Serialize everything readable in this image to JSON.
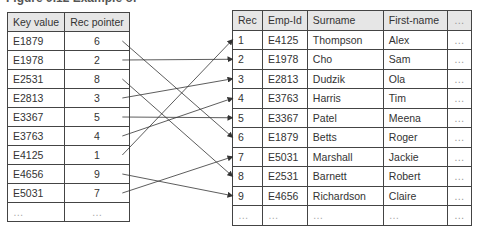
{
  "title": "Figure 9.12 Example of",
  "index_table": {
    "headers": [
      "Key value",
      "Rec pointer"
    ],
    "rows": [
      {
        "key": "E1879",
        "ptr": "6"
      },
      {
        "key": "E1978",
        "ptr": "2"
      },
      {
        "key": "E2531",
        "ptr": "8"
      },
      {
        "key": "E2813",
        "ptr": "3"
      },
      {
        "key": "E3367",
        "ptr": "5"
      },
      {
        "key": "E3763",
        "ptr": "4"
      },
      {
        "key": "E4125",
        "ptr": "1"
      },
      {
        "key": "E4656",
        "ptr": "9"
      },
      {
        "key": "E5031",
        "ptr": "7"
      },
      {
        "key": "…",
        "ptr": "…"
      }
    ]
  },
  "data_table": {
    "headers": [
      "Rec",
      "Emp-Id",
      "Surname",
      "First-name",
      "…"
    ],
    "rows": [
      {
        "rec": "1",
        "emp": "E4125",
        "surname": "Thompson",
        "first": "Alex",
        "more": "…"
      },
      {
        "rec": "2",
        "emp": "E1978",
        "surname": "Cho",
        "first": "Sam",
        "more": "…"
      },
      {
        "rec": "3",
        "emp": "E2813",
        "surname": "Dudzik",
        "first": "Ola",
        "more": "…"
      },
      {
        "rec": "4",
        "emp": "E3763",
        "surname": "Harris",
        "first": "Tim",
        "more": "…"
      },
      {
        "rec": "5",
        "emp": "E3367",
        "surname": "Patel",
        "first": "Meena",
        "more": "…"
      },
      {
        "rec": "6",
        "emp": "E1879",
        "surname": "Betts",
        "first": "Roger",
        "more": "…"
      },
      {
        "rec": "7",
        "emp": "E5031",
        "surname": "Marshall",
        "first": "Jackie",
        "more": "…"
      },
      {
        "rec": "8",
        "emp": "E2531",
        "surname": "Barnett",
        "first": "Robert",
        "more": "…"
      },
      {
        "rec": "9",
        "emp": "E4656",
        "surname": "Richardson",
        "first": "Claire",
        "more": "…"
      },
      {
        "rec": "…",
        "emp": "…",
        "surname": "…",
        "first": "…",
        "more": "…"
      }
    ]
  },
  "arrows": [
    {
      "from_key": "E1879",
      "to_rec": "6"
    },
    {
      "from_key": "E1978",
      "to_rec": "2"
    },
    {
      "from_key": "E2531",
      "to_rec": "8"
    },
    {
      "from_key": "E2813",
      "to_rec": "3"
    },
    {
      "from_key": "E3367",
      "to_rec": "5"
    },
    {
      "from_key": "E3763",
      "to_rec": "4"
    },
    {
      "from_key": "E4125",
      "to_rec": "1"
    },
    {
      "from_key": "E4656",
      "to_rec": "9"
    },
    {
      "from_key": "E5031",
      "to_rec": "7"
    }
  ],
  "colors": {
    "header_bg": "#e6e6e6",
    "border": "#444444",
    "arrow": "#333333"
  }
}
